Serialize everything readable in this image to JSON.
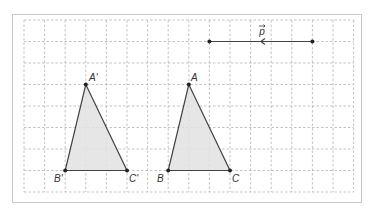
{
  "diagram": {
    "title": "",
    "frame": {
      "x": 12,
      "y": 14,
      "width": 349,
      "height": 188,
      "border_color": "#c8c8c8"
    },
    "grid": {
      "x_lines": [
        24,
        44.6,
        65.2,
        85.8,
        106.4,
        127,
        147.6,
        168.2,
        188.8,
        209.4,
        230,
        250.6,
        271.2,
        291.8,
        312.4,
        333,
        353.6
      ],
      "y_lines": [
        20,
        41.5,
        63,
        84.5,
        106,
        127.5,
        149,
        170.5,
        192
      ],
      "color": "#b4b4b4",
      "style": "dashed"
    },
    "colors": {
      "fill": "#e2e2e2",
      "stroke": "#444444",
      "point": "#222222",
      "label": "#333333"
    },
    "vector": {
      "label": "p",
      "from": [
        312.4,
        41.5
      ],
      "to": [
        209.4,
        41.5
      ],
      "direction": "left",
      "label_pos": [
        262,
        35
      ]
    },
    "triangles": [
      {
        "name": "image",
        "vertices": [
          {
            "label": "A'",
            "x": 85.8,
            "y": 84.5,
            "lx": 89,
            "ly": 81
          },
          {
            "label": "B'",
            "x": 65.2,
            "y": 170.5,
            "lx": 54,
            "ly": 182
          },
          {
            "label": "C'",
            "x": 127,
            "y": 170.5,
            "lx": 129,
            "ly": 182
          }
        ]
      },
      {
        "name": "original",
        "vertices": [
          {
            "label": "A",
            "x": 188.8,
            "y": 84.5,
            "lx": 191,
            "ly": 81
          },
          {
            "label": "B",
            "x": 168.2,
            "y": 170.5,
            "lx": 157,
            "ly": 182
          },
          {
            "label": "C",
            "x": 230,
            "y": 170.5,
            "lx": 232,
            "ly": 182
          }
        ]
      }
    ]
  }
}
